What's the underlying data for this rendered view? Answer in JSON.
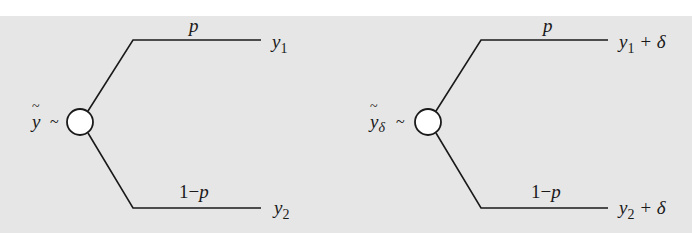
{
  "colors": {
    "background": "#e6e6e6",
    "line": "#1a1a1a",
    "node_fill": "#ffffff"
  },
  "trees": [
    {
      "variable": "y",
      "variable_subscript": "",
      "relation": "~",
      "branches": [
        {
          "probability": "p",
          "outcome": "y",
          "outcome_subscript": "1",
          "outcome_suffix": ""
        },
        {
          "probability_prefix": "1−",
          "probability": "p",
          "outcome": "y",
          "outcome_subscript": "2",
          "outcome_suffix": ""
        }
      ]
    },
    {
      "variable": "y",
      "variable_subscript": "δ",
      "relation": "~",
      "branches": [
        {
          "probability": "p",
          "outcome": "y",
          "outcome_subscript": "1",
          "outcome_suffix": " + δ"
        },
        {
          "probability_prefix": "1−",
          "probability": "p",
          "outcome": "y",
          "outcome_subscript": "2",
          "outcome_suffix": " + δ"
        }
      ]
    }
  ]
}
